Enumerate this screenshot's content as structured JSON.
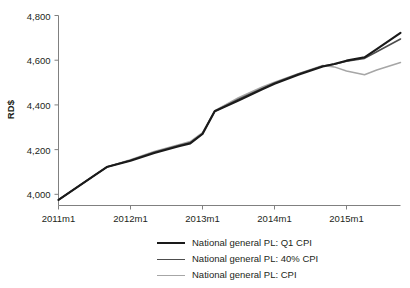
{
  "chart_data": {
    "type": "line",
    "title": "",
    "subtitle": "",
    "xlabel": "",
    "ylabel": "RD$",
    "ylim": [
      3950,
      4800
    ],
    "xlim": [
      2011.0,
      2015.75
    ],
    "grid": false,
    "legend_position": "bottom-center",
    "y_ticks": [
      4000,
      4200,
      4400,
      4600,
      4800
    ],
    "y_tick_labels": [
      "4,000",
      "4,200",
      "4,400",
      "4,600",
      "4,800"
    ],
    "x_ticks": [
      2011.0,
      2012.0,
      2013.0,
      2014.0,
      2015.0
    ],
    "x_tick_labels": [
      "2011m1",
      "2012m1",
      "2013m1",
      "2014m1",
      "2015m1"
    ],
    "series": [
      {
        "name": "National general PL: Q1 CPI",
        "color": "#1a1a1a",
        "width": 2.1,
        "x": [
          2011.0,
          2011.25,
          2011.5,
          2011.67,
          2012.0,
          2012.33,
          2012.67,
          2012.83,
          2013.0,
          2013.17,
          2013.5,
          2013.83,
          2014.0,
          2014.33,
          2014.67,
          2014.83,
          2015.0,
          2015.25,
          2015.42,
          2015.75
        ],
        "y": [
          3975,
          4030,
          4085,
          4122,
          4150,
          4185,
          4215,
          4228,
          4270,
          4372,
          4420,
          4470,
          4495,
          4535,
          4572,
          4583,
          4598,
          4613,
          4650,
          4722
        ]
      },
      {
        "name": "National general PL: 40% CPI",
        "color": "#4d4d4d",
        "width": 1.6,
        "x": [
          2011.0,
          2011.25,
          2011.5,
          2011.67,
          2012.0,
          2012.33,
          2012.67,
          2012.83,
          2013.0,
          2013.17,
          2013.5,
          2013.83,
          2014.0,
          2014.33,
          2014.67,
          2014.83,
          2015.0,
          2015.25,
          2015.42,
          2015.75
        ],
        "y": [
          3975,
          4030,
          4085,
          4122,
          4152,
          4188,
          4218,
          4231,
          4272,
          4372,
          4425,
          4474,
          4498,
          4538,
          4574,
          4582,
          4596,
          4608,
          4638,
          4695
        ]
      },
      {
        "name": "National general PL: CPI",
        "color": "#a6a6a6",
        "width": 1.5,
        "x": [
          2011.0,
          2011.25,
          2011.5,
          2011.67,
          2012.0,
          2012.33,
          2012.67,
          2012.83,
          2013.0,
          2013.17,
          2013.5,
          2013.83,
          2014.0,
          2014.33,
          2014.67,
          2014.83,
          2015.0,
          2015.25,
          2015.42,
          2015.75
        ],
        "y": [
          3975,
          4030,
          4085,
          4122,
          4155,
          4192,
          4222,
          4236,
          4276,
          4374,
          4432,
          4480,
          4502,
          4540,
          4576,
          4570,
          4552,
          4535,
          4556,
          4590
        ]
      }
    ]
  },
  "legend": {
    "items": [
      {
        "label": "National general PL: Q1 CPI",
        "color": "#1a1a1a"
      },
      {
        "label": "National general PL: 40% CPI",
        "color": "#4d4d4d"
      },
      {
        "label": "National general PL: CPI",
        "color": "#a6a6a6"
      }
    ]
  },
  "axis": {
    "y_title": "RD$",
    "spine_color": "#808080"
  }
}
